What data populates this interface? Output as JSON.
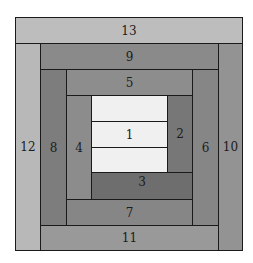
{
  "diagram": {
    "type": "log-cabin-quilt-block",
    "pieces": [
      {
        "id": "13",
        "label": "13",
        "color": "#bdbdbd"
      },
      {
        "id": "12",
        "label": "12",
        "color": "#b8b8b8"
      },
      {
        "id": "9",
        "label": "9",
        "color": "#8a8a8a"
      },
      {
        "id": "10",
        "label": "10",
        "color": "#939393"
      },
      {
        "id": "11",
        "label": "11",
        "color": "#999999"
      },
      {
        "id": "8",
        "label": "8",
        "color": "#7d7d7d"
      },
      {
        "id": "5",
        "label": "5",
        "color": "#8d8d8d"
      },
      {
        "id": "6",
        "label": "6",
        "color": "#868686"
      },
      {
        "id": "7",
        "label": "7",
        "color": "#868686"
      },
      {
        "id": "4",
        "label": "4",
        "color": "#8c8c8c"
      },
      {
        "id": "3",
        "label": "3",
        "color": "#6e6e6e"
      },
      {
        "id": "2",
        "label": "2",
        "color": "#777777"
      },
      {
        "id": "1",
        "label": "1",
        "color": "#f0f0f0"
      }
    ]
  }
}
